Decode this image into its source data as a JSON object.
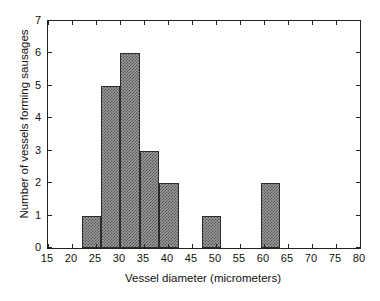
{
  "chart_data": {
    "type": "bar",
    "title": "",
    "xlabel": "Vessel diameter (micrometers)",
    "ylabel": "Number of vessels forming sausages",
    "xlim": [
      15,
      80
    ],
    "ylim": [
      0,
      7
    ],
    "xticks": [
      15,
      20,
      25,
      30,
      35,
      40,
      45,
      50,
      55,
      60,
      65,
      70,
      75,
      80
    ],
    "yticks": [
      0,
      1,
      2,
      3,
      4,
      5,
      6,
      7
    ],
    "grid": false,
    "legend": null,
    "bin_width": 4,
    "bins": [
      {
        "x0": 22.1,
        "x1": 26.1,
        "value": 1
      },
      {
        "x0": 26.1,
        "x1": 30.1,
        "value": 5
      },
      {
        "x0": 30.1,
        "x1": 34.1,
        "value": 6
      },
      {
        "x0": 34.1,
        "x1": 38.1,
        "value": 3
      },
      {
        "x0": 38.1,
        "x1": 42.2,
        "value": 2
      },
      {
        "x0": 47.0,
        "x1": 51.0,
        "value": 1
      },
      {
        "x0": 59.3,
        "x1": 63.3,
        "value": 2
      }
    ],
    "categories": [
      "22-26",
      "26-30",
      "30-34",
      "34-38",
      "38-42",
      "47-51",
      "59-63"
    ],
    "values": [
      1,
      5,
      6,
      3,
      2,
      1,
      2
    ],
    "colors": {
      "bar_fill": "#9a9a9a",
      "bar_edge": "#2b2b2b",
      "axis": "#222222",
      "background": "#ffffff",
      "text": "#111111"
    }
  }
}
